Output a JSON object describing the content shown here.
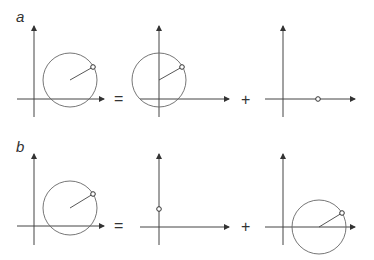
{
  "rows": [
    {
      "label": "a",
      "operators": [
        "=",
        "+"
      ],
      "panels": [
        {
          "name": "total",
          "circle": true,
          "center": [
            70,
            80
          ],
          "point": [
            93,
            67
          ],
          "radius": 27,
          "origin": [
            34,
            99
          ]
        },
        {
          "name": "component-1",
          "circle": true,
          "center": [
            159,
            80
          ],
          "point": [
            182,
            67
          ],
          "radius": 27,
          "origin": [
            159,
            99
          ]
        },
        {
          "name": "component-2",
          "circle": false,
          "point": [
            318,
            99
          ],
          "origin": [
            283,
            99
          ]
        }
      ]
    },
    {
      "label": "b",
      "operators": [
        "=",
        "+"
      ],
      "panels": [
        {
          "name": "total",
          "circle": true,
          "center": [
            70,
            208
          ],
          "point": [
            93,
            194
          ],
          "radius": 27,
          "origin": [
            34,
            226
          ]
        },
        {
          "name": "component-1",
          "circle": false,
          "point": [
            159,
            209
          ],
          "origin": [
            159,
            227
          ]
        },
        {
          "name": "component-2",
          "circle": true,
          "center": [
            319,
            227
          ],
          "point": [
            342,
            213
          ],
          "radius": 27,
          "origin": [
            283,
            227
          ]
        }
      ]
    }
  ],
  "colors": {
    "stroke": "#444444",
    "circle": "#666666"
  }
}
